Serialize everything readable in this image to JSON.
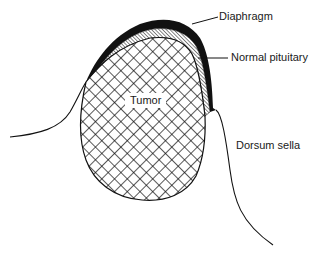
{
  "figure": {
    "labels": {
      "diaphragm": "Diaphragm",
      "normal_pituitary": "Normal pituitary",
      "tumor": "Tumor",
      "dorsum_sella": "Dorsum sella"
    },
    "colors": {
      "ink": "#111111",
      "background": "#ffffff"
    }
  }
}
